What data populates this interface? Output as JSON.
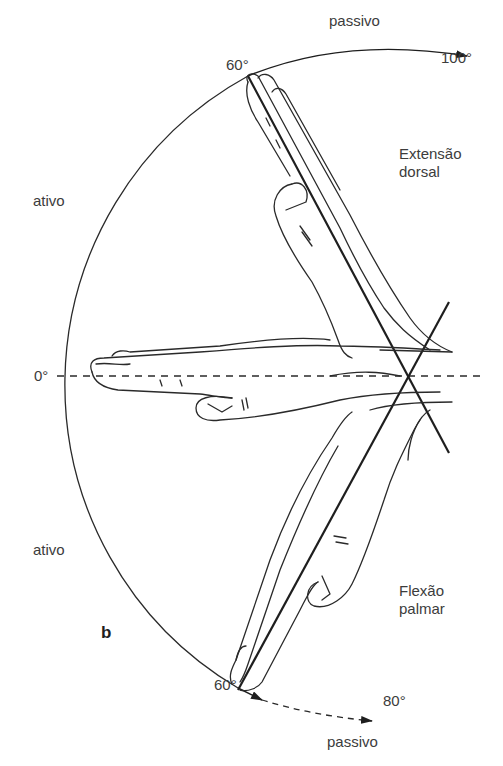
{
  "figure": {
    "panel_label": "b"
  },
  "labels": {
    "passive_top": "passivo",
    "passive_bottom": "passivo",
    "active_top": "ativo",
    "active_bottom": "ativo",
    "zero": "0°",
    "extension_active_angle": "60°",
    "extension_passive_angle": "100°",
    "flexion_active_angle": "60°",
    "flexion_passive_angle": "80°",
    "extension_line1": "Extensão",
    "extension_line2": "dorsal",
    "flexion_line1": "Flexão",
    "flexion_line2": "palmar"
  },
  "angles": {
    "neutral": 0,
    "dorsal_extension": {
      "active": 60,
      "passive": 100
    },
    "palmar_flexion": {
      "active": 60,
      "passive": 80
    }
  },
  "colors": {
    "line": "#2a2a2a",
    "text": "#3c3c3c",
    "background": "#ffffff"
  }
}
